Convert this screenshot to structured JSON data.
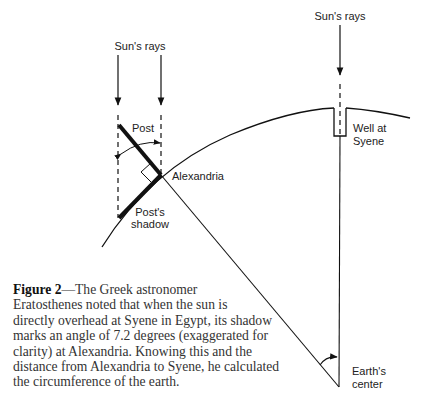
{
  "labels": {
    "sun_rays_left": "Sun's rays",
    "sun_rays_right": "Sun's rays",
    "post": "Post",
    "alexandria": "Alexandria",
    "post_shadow_line1": "Post's",
    "post_shadow_line2": "shadow",
    "well_line1": "Well at",
    "well_line2": "Syene",
    "earth_center_line1": "Earth's",
    "earth_center_line2": "center"
  },
  "caption": {
    "figure_label": "Figure 2",
    "lines": [
      "—The Greek astronomer",
      "Eratosthenes noted that when the sun is",
      "directly overhead at Syene in Egypt, its shadow",
      "marks an angle of 7.2 degrees (exaggerated for",
      "clarity) at  Alexandria. Knowing this and the",
      "distance from Alexandria to Syene, he calculated",
      "the circumference of the earth."
    ]
  },
  "angle_degrees": "7.2",
  "colors": {
    "ink": "#111111",
    "text": "#333333",
    "background": "#ffffff"
  }
}
